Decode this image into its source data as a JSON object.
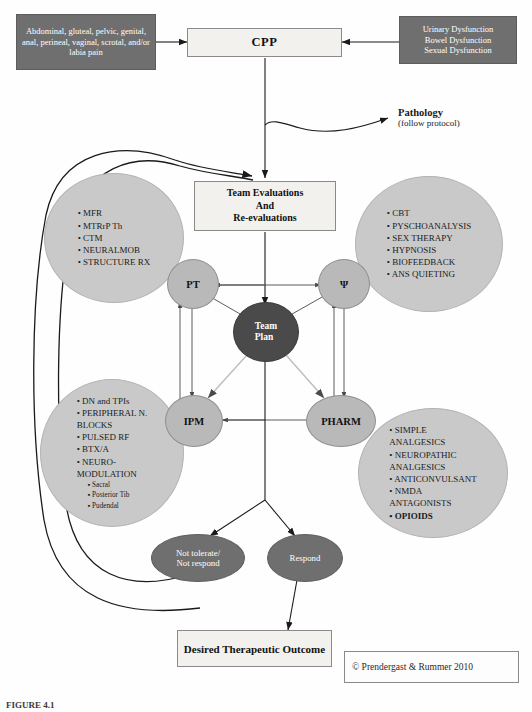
{
  "diagram": {
    "colors": {
      "dark_box": "#6f6f6f",
      "light_box": "#f2f1ee",
      "bubble": "#c9c9c9",
      "role_node": "#b9b9b9",
      "team_plan": "#4a4a4a",
      "response_node": "#6f6f6f",
      "line": "#1a1a1a"
    },
    "inputs": {
      "left_symptoms": "Abdominal, gluteal, pelvic, genital, anal, perineal, vaginal, scrotal, and/or labia pain",
      "right_dysfunctions": "Urinary Dysfunction\nBowel Dysfunction\nSexual Dysfunction"
    },
    "cpp": "CPP",
    "pathology": {
      "label": "Pathology",
      "sub": "(follow protocol)"
    },
    "team_evaluations": "Team Evaluations\nAnd\nRe-evaluations",
    "team_plan": "Team\nPlan",
    "roles": {
      "pt": "PT",
      "psych": "Ψ",
      "ipm": "IPM",
      "pharm": "PHARM"
    },
    "bubbles": {
      "pt": [
        {
          "text": "MFR"
        },
        {
          "text": "MTRrP Th"
        },
        {
          "text": "CTM"
        },
        {
          "text": "NEURALMOB"
        },
        {
          "text": "STRUCTURE RX"
        }
      ],
      "psych": [
        {
          "text": "CBT"
        },
        {
          "text": "PYSCHOANALYSIS"
        },
        {
          "text": "SEX THERAPY"
        },
        {
          "text": "HYPNOSIS"
        },
        {
          "text": "BIOFEEDBACK"
        },
        {
          "text": "ANS QUIETING"
        }
      ],
      "ipm": [
        {
          "text": "DN and TPIs"
        },
        {
          "text": "PERIPHERAL N.\n   BLOCKS"
        },
        {
          "text": "PULSED RF"
        },
        {
          "text": "BTX/A"
        },
        {
          "text": "NEURO-\n   MODULATION"
        },
        {
          "text": "Sacral",
          "sub": true
        },
        {
          "text": "Posterior Tib",
          "sub": true
        },
        {
          "text": "Pudendal",
          "sub": true
        }
      ],
      "pharm": [
        {
          "text": "SIMPLE\n   ANALGESICS"
        },
        {
          "text": "NEUROPATHIC\n   ANALGESICS"
        },
        {
          "text": "ANTICONVULSANT"
        },
        {
          "text": "NMDA\n   ANTAGONISTS"
        },
        {
          "text": "OPIOIDS",
          "bold": true
        }
      ]
    },
    "responses": {
      "not_respond": "Not tolerate/\nNot respond",
      "respond": "Respond"
    },
    "final_outcome": "Desired Therapeutic Outcome",
    "copyright": "© Prendergast & Rummer 2010",
    "caption": "FIGURE 4.1"
  }
}
